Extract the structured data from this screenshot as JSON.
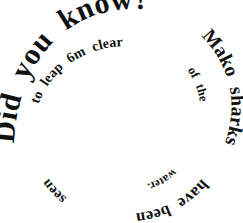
{
  "graphic": {
    "kind": "spiral-text-graphic",
    "background_color": "#ffffff",
    "text_color": "#111111",
    "full_text": "Did you know?Mako sharks have been seen to leap 6m clear of the water.",
    "headline": "Did you know?",
    "fact": "Mako sharks have been seen to leap 6m clear of the water.",
    "spiral_center": "120,118",
    "direction": "clockwise-inward",
    "segments": {
      "headline_1": "Did",
      "headline_2": "you",
      "headline_3": "know?",
      "outer_1": "Mako",
      "outer_2": "sharks",
      "outer_3": "have",
      "outer_4": "been",
      "outer_5": "seen",
      "inner_1": "to",
      "inner_2": "leap",
      "inner_3": "6m",
      "inner_4": "clear",
      "inner_5": "of",
      "inner_6": "the",
      "inner_7": "water."
    },
    "measurement": "6m",
    "subject": "Mako sharks"
  }
}
